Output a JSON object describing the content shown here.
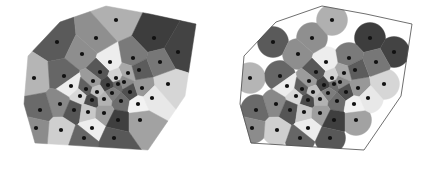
{
  "figure": {
    "background_color": "#ffffff",
    "width": 433,
    "height": 171,
    "seed_color": "#111111",
    "seed_radius": 2.1,
    "outline_color": "#4a4a4a"
  },
  "panels": [
    {
      "id": "voronoi-full",
      "label": "Voronoi diagram clipped to boundary polygon",
      "origin_x": 0,
      "origin_y": 0,
      "clip_mode": "polygon",
      "show_outline": false
    },
    {
      "id": "voronoi-disks",
      "label": "Voronoi cells intersected with fixed-radius disks",
      "origin_x": 216,
      "origin_y": 0,
      "clip_mode": "polygon-and-disk",
      "disk_radius": 15.5,
      "show_outline": true
    }
  ],
  "palette": {
    "grays": [
      "#3a3a3a",
      "#4c4c4c",
      "#5e5e5e",
      "#6f6f6f",
      "#828282",
      "#949494",
      "#a6a6a6",
      "#b8b8b8",
      "#cacaca",
      "#dcdcdc",
      "#ededed",
      "#f7f7f7"
    ],
    "white": "#ffffff",
    "black": "#111111"
  },
  "chart_data": {
    "type": "scatter",
    "xlabel": "",
    "ylabel": "",
    "xlim": [
      0,
      216
    ],
    "ylim": [
      0,
      171
    ],
    "grid": false,
    "legend": "none",
    "boundary_polygon": [
      [
        60,
        22
      ],
      [
        106,
        6
      ],
      [
        150,
        14
      ],
      [
        196,
        24
      ],
      [
        185,
        96
      ],
      [
        148,
        150
      ],
      [
        35,
        143
      ],
      [
        24,
        104
      ],
      [
        28,
        56
      ]
    ],
    "points": [
      {
        "x": 116,
        "y": 20,
        "shade": "#b0b0b0"
      },
      {
        "x": 57,
        "y": 42,
        "shade": "#5a5a5a"
      },
      {
        "x": 82,
        "y": 54,
        "shade": "#8e8e8e"
      },
      {
        "x": 154,
        "y": 38,
        "shade": "#3d3d3d"
      },
      {
        "x": 178,
        "y": 52,
        "shade": "#434343"
      },
      {
        "x": 110,
        "y": 62,
        "shade": "#ededed"
      },
      {
        "x": 133,
        "y": 58,
        "shade": "#7a7a7a"
      },
      {
        "x": 128,
        "y": 73,
        "shade": "#a8a8a8"
      },
      {
        "x": 34,
        "y": 78,
        "shade": "#b5b5b5"
      },
      {
        "x": 64,
        "y": 76,
        "shade": "#666666"
      },
      {
        "x": 100,
        "y": 72,
        "shade": "#575757"
      },
      {
        "x": 116,
        "y": 78,
        "shade": "#d2d2d2"
      },
      {
        "x": 118,
        "y": 84,
        "shade": "#6b6b6b"
      },
      {
        "x": 93,
        "y": 81,
        "shade": "#9b9b9b"
      },
      {
        "x": 108,
        "y": 85,
        "shade": "#444444"
      },
      {
        "x": 124,
        "y": 82,
        "shade": "#8a8a8a"
      },
      {
        "x": 71,
        "y": 86,
        "shade": "#ededed"
      },
      {
        "x": 86,
        "y": 89,
        "shade": "#606060"
      },
      {
        "x": 97,
        "y": 92,
        "shade": "#c0c0c0"
      },
      {
        "x": 112,
        "y": 93,
        "shade": "#7d7d7d"
      },
      {
        "x": 130,
        "y": 92,
        "shade": "#505050"
      },
      {
        "x": 142,
        "y": 88,
        "shade": "#989898"
      },
      {
        "x": 80,
        "y": 96,
        "shade": "#d8d8d8"
      },
      {
        "x": 92,
        "y": 100,
        "shade": "#4b4b4b"
      },
      {
        "x": 104,
        "y": 99,
        "shade": "#b2b2b2"
      },
      {
        "x": 121,
        "y": 101,
        "shade": "#6e6e6e"
      },
      {
        "x": 138,
        "y": 104,
        "shade": "#f2f2f2"
      },
      {
        "x": 60,
        "y": 104,
        "shade": "#888888"
      },
      {
        "x": 74,
        "y": 110,
        "shade": "#555555"
      },
      {
        "x": 88,
        "y": 112,
        "shade": "#c8c8c8"
      },
      {
        "x": 104,
        "y": 113,
        "shade": "#9e9e9e"
      },
      {
        "x": 152,
        "y": 98,
        "shade": "#e8e8e8"
      },
      {
        "x": 168,
        "y": 84,
        "shade": "#d6d6d6"
      },
      {
        "x": 40,
        "y": 110,
        "shade": "#6a6a6a"
      },
      {
        "x": 118,
        "y": 120,
        "shade": "#3f3f3f"
      },
      {
        "x": 92,
        "y": 128,
        "shade": "#ededed"
      },
      {
        "x": 140,
        "y": 120,
        "shade": "#a2a2a2"
      },
      {
        "x": 61,
        "y": 130,
        "shade": "#cfcfcf"
      },
      {
        "x": 84,
        "y": 138,
        "shade": "#666666"
      },
      {
        "x": 114,
        "y": 138,
        "shade": "#585858"
      },
      {
        "x": 36,
        "y": 128,
        "shade": "#8c8c8c"
      },
      {
        "x": 139,
        "y": 70,
        "shade": "#5c5c5c"
      },
      {
        "x": 160,
        "y": 62,
        "shade": "#777777"
      },
      {
        "x": 96,
        "y": 38,
        "shade": "#8f8f8f"
      }
    ]
  }
}
